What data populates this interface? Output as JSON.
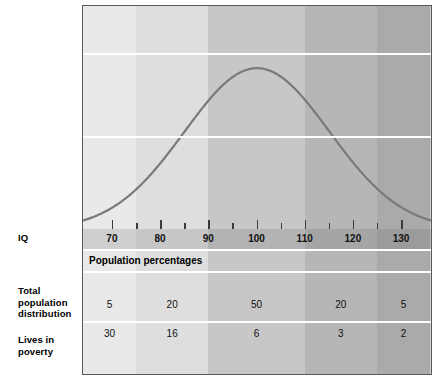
{
  "row_labels": {
    "iq": "IQ",
    "total_population_distribution": "Total\npopulation\ndistribution",
    "lives_in_poverty": "Lives in\npoverty"
  },
  "section_heading": "Population percentages",
  "chart_data": {
    "type": "area",
    "title": "",
    "subtitle": "",
    "xlabel": "IQ",
    "ylabel": "",
    "xlim": [
      64,
      136
    ],
    "grid": true,
    "legend": false,
    "axis_tick_labels": [
      "70",
      "80",
      "90",
      "100",
      "110",
      "120",
      "130"
    ],
    "axis_tick_values": [
      70,
      80,
      90,
      100,
      110,
      120,
      130
    ],
    "axis_minor_tick_values": [
      75,
      85,
      95,
      105,
      115,
      125
    ],
    "curve": {
      "name": "IQ normal distribution",
      "mean": 100,
      "std_dev": 15,
      "color": "#7a7a7a"
    },
    "bands": [
      {
        "range_label": "under 75",
        "x_start": 64,
        "x_end": 75,
        "color": "#e9e9e9"
      },
      {
        "range_label": "75 to 90",
        "x_start": 75,
        "x_end": 90,
        "color": "#dedede"
      },
      {
        "range_label": "90 to 110",
        "x_start": 90,
        "x_end": 110,
        "color": "#c7c7c7"
      },
      {
        "range_label": "110 to 125",
        "x_start": 110,
        "x_end": 125,
        "color": "#b6b6b6"
      },
      {
        "range_label": "over 125",
        "x_start": 125,
        "x_end": 136,
        "color": "#aaaaaa"
      }
    ],
    "series": [
      {
        "name": "Total population distribution",
        "unit": "percent",
        "values": [
          5,
          20,
          50,
          20,
          5
        ]
      },
      {
        "name": "Lives in poverty",
        "unit": "percent",
        "values": [
          30,
          16,
          6,
          3,
          2
        ]
      }
    ]
  }
}
